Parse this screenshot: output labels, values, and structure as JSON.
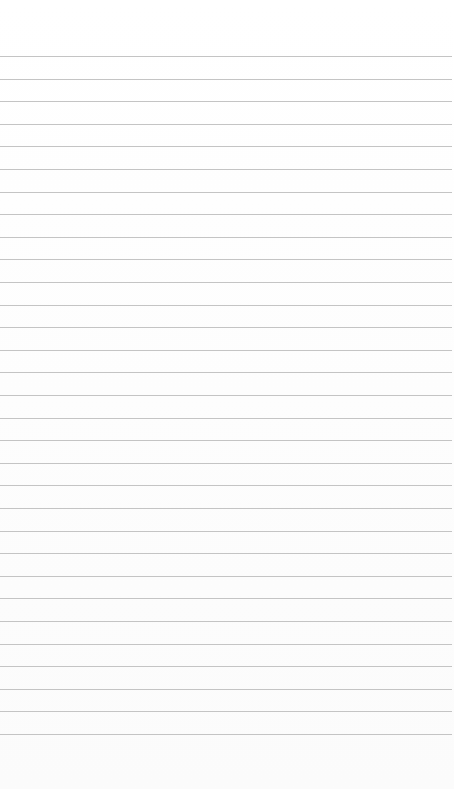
{
  "paper": {
    "type": "lined notepad page",
    "background_color": "#fefefe",
    "rule_color": "#c4c4c4",
    "rule_count": 31,
    "first_rule_y": 56,
    "rule_spacing": 22.6
  }
}
